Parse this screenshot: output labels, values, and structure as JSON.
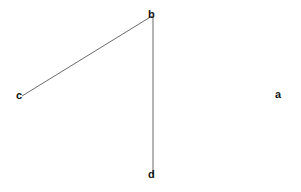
{
  "diagram": {
    "canvas": {
      "width": 301,
      "height": 192,
      "background_color": "#ffffff"
    },
    "style": {
      "line_color": "#6b6b6b",
      "line_width": 1,
      "label_color": "#141414",
      "label_font_size": 11
    },
    "points": [
      {
        "id": "b",
        "label": "b",
        "x": 152,
        "y": 15,
        "label_x": 148,
        "label_y": 10
      },
      {
        "id": "c",
        "label": "c",
        "x": 22,
        "y": 96,
        "label_x": 16,
        "label_y": 91
      },
      {
        "id": "d",
        "label": "d",
        "x": 153,
        "y": 174,
        "label_x": 148,
        "label_y": 170
      },
      {
        "id": "a",
        "label": "a",
        "x": 280,
        "y": 96,
        "label_x": 275,
        "label_y": 90
      }
    ],
    "segments": [
      {
        "id": "cb",
        "from": "c",
        "to": "b",
        "x1": 22,
        "y1": 96,
        "x2": 152,
        "y2": 16
      },
      {
        "id": "bd",
        "from": "b",
        "to": "d",
        "x1": 153,
        "y1": 16,
        "x2": 153,
        "y2": 175
      }
    ]
  }
}
